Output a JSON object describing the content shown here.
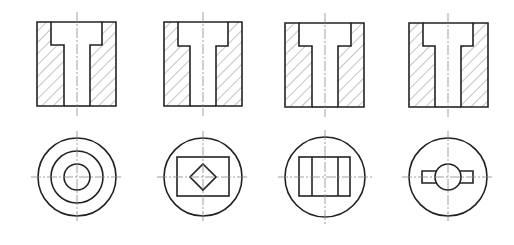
{
  "diagram": {
    "type": "engineering-drawing",
    "colors": {
      "outline": "#222222",
      "hatch": "#555555",
      "centerline": "#888888",
      "background": "#ffffff"
    },
    "views": [
      {
        "id": "variant-1",
        "section": {
          "x": 37,
          "y": 22,
          "w": 79,
          "h": 84,
          "cb_left": 51,
          "cb_right": 102,
          "cb_depth_y": 45,
          "bore_left": 64,
          "bore_right": 90,
          "cx": 77
        },
        "top_view": {
          "cx": 77,
          "cy": 177,
          "shape": "concentric-circles",
          "outer_r": 39,
          "middle_r": 26,
          "inner_r": 13
        }
      },
      {
        "id": "variant-2",
        "section": {
          "x": 164,
          "y": 22,
          "w": 78,
          "h": 84,
          "cb_left": 178,
          "cb_right": 228,
          "cb_depth_y": 46,
          "bore_left": 190,
          "bore_right": 216,
          "cx": 203
        },
        "top_view": {
          "cx": 203,
          "cy": 177,
          "shape": "rectangle-with-diamond",
          "outer_r": 39,
          "rect": {
            "x": 177,
            "y": 157,
            "w": 52,
            "h": 39
          },
          "diamond_half": 13
        }
      },
      {
        "id": "variant-3",
        "section": {
          "x": 285,
          "y": 23,
          "w": 79,
          "h": 84,
          "cb_left": 299,
          "cb_right": 351,
          "cb_depth_y": 46,
          "bore_left": 312,
          "bore_right": 338,
          "cx": 325
        },
        "top_view": {
          "cx": 325,
          "cy": 177,
          "shape": "rectangle-with-vertical-lines",
          "outer_r": 40,
          "rect": {
            "x": 299,
            "y": 157,
            "w": 51,
            "h": 39
          },
          "inner_lines_x": [
            312,
            338
          ]
        }
      },
      {
        "id": "variant-4",
        "section": {
          "x": 409,
          "y": 23,
          "w": 79,
          "h": 84,
          "cb_left": 423,
          "cb_right": 473,
          "cb_depth_y": 46,
          "bore_left": 435,
          "bore_right": 461,
          "cx": 448
        },
        "top_view": {
          "cx": 448,
          "cy": 177,
          "shape": "circle-with-side-tabs",
          "outer_r": 39,
          "inner_r": 13,
          "tabs": {
            "x1": 422,
            "x2": 473,
            "y1": 171,
            "y2": 183
          }
        }
      }
    ]
  }
}
